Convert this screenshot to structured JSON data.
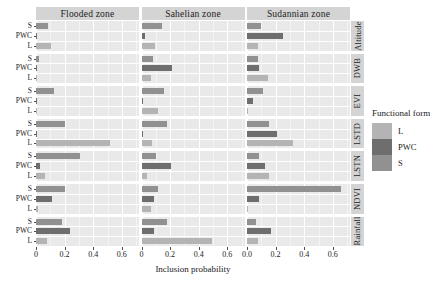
{
  "axis": {
    "xlabel": "Inclusion probability",
    "xticks_left": [
      "0",
      "0.2",
      "0.4",
      "0.6"
    ],
    "xticks_right": [
      "0.0",
      "0.2",
      "0.4",
      "0.6"
    ],
    "xtick_values": [
      0,
      0.2,
      0.4,
      0.6
    ],
    "xlim": [
      0,
      0.72
    ],
    "ycategories": [
      "S",
      "PWC",
      "L"
    ]
  },
  "legend": {
    "title": "Functional form",
    "items": [
      {
        "label": "L",
        "color": "#b4b4b4"
      },
      {
        "label": "PWC",
        "color": "#6e6e6e"
      },
      {
        "label": "S",
        "color": "#919191"
      }
    ]
  },
  "panels": {
    "columns": [
      "Flooded zone",
      "Sahelian zone",
      "Sudannian zone"
    ],
    "rows": [
      "Altitude",
      "DWB",
      "EVI",
      "LSTD",
      "LSTN",
      "NDVI",
      "Rainfall"
    ]
  },
  "colors": {
    "panel_bg": "#e9e9e9",
    "strip_bg": "#d4d4d4",
    "gridline": "#ffffff",
    "L": "#b4b4b4",
    "PWC": "#6e6e6e",
    "S": "#919191"
  },
  "chart_data": {
    "type": "bar",
    "orientation": "horizontal",
    "title": "",
    "xlabel": "Inclusion probability",
    "ylabel": "",
    "xlim": [
      0,
      0.72
    ],
    "grid": true,
    "legend_position": "right",
    "facet_cols": [
      "Flooded zone",
      "Sahelian zone",
      "Sudannian zone"
    ],
    "facet_rows": [
      "Altitude",
      "DWB",
      "EVI",
      "LSTD",
      "LSTN",
      "NDVI",
      "Rainfall"
    ],
    "categories": [
      "S",
      "PWC",
      "L"
    ],
    "panels": [
      {
        "row": "Altitude",
        "col": "Flooded zone",
        "series": [
          {
            "name": "S",
            "value": 0.085
          },
          {
            "name": "PWC",
            "value": 0.005
          },
          {
            "name": "L",
            "value": 0.105
          }
        ]
      },
      {
        "row": "Altitude",
        "col": "Sahelian zone",
        "series": [
          {
            "name": "S",
            "value": 0.145
          },
          {
            "name": "PWC",
            "value": 0.025
          },
          {
            "name": "L",
            "value": 0.095
          }
        ]
      },
      {
        "row": "Altitude",
        "col": "Sudannian zone",
        "series": [
          {
            "name": "S",
            "value": 0.1
          },
          {
            "name": "PWC",
            "value": 0.255
          },
          {
            "name": "L",
            "value": 0.075
          }
        ]
      },
      {
        "row": "DWB",
        "col": "Flooded zone",
        "series": [
          {
            "name": "S",
            "value": 0.02
          },
          {
            "name": "PWC",
            "value": 0.005
          },
          {
            "name": "L",
            "value": 0.0
          }
        ]
      },
      {
        "row": "DWB",
        "col": "Sahelian zone",
        "series": [
          {
            "name": "S",
            "value": 0.08
          },
          {
            "name": "PWC",
            "value": 0.215
          },
          {
            "name": "L",
            "value": 0.065
          }
        ]
      },
      {
        "row": "DWB",
        "col": "Sudannian zone",
        "series": [
          {
            "name": "S",
            "value": 0.075
          },
          {
            "name": "PWC",
            "value": 0.085
          },
          {
            "name": "L",
            "value": 0.145
          }
        ]
      },
      {
        "row": "EVI",
        "col": "Flooded zone",
        "series": [
          {
            "name": "S",
            "value": 0.125
          },
          {
            "name": "PWC",
            "value": 0.005
          },
          {
            "name": "L",
            "value": 0.0
          }
        ]
      },
      {
        "row": "EVI",
        "col": "Sahelian zone",
        "series": [
          {
            "name": "S",
            "value": 0.155
          },
          {
            "name": "PWC",
            "value": 0.006
          },
          {
            "name": "L",
            "value": 0.115
          }
        ]
      },
      {
        "row": "EVI",
        "col": "Sudannian zone",
        "series": [
          {
            "name": "S",
            "value": 0.11
          },
          {
            "name": "PWC",
            "value": 0.045
          },
          {
            "name": "L",
            "value": 0.004
          }
        ]
      },
      {
        "row": "LSTD",
        "col": "Flooded zone",
        "series": [
          {
            "name": "S",
            "value": 0.205
          },
          {
            "name": "PWC",
            "value": 0.005
          },
          {
            "name": "L",
            "value": 0.515
          }
        ]
      },
      {
        "row": "LSTD",
        "col": "Sahelian zone",
        "series": [
          {
            "name": "S",
            "value": 0.175
          },
          {
            "name": "PWC",
            "value": 0.005
          },
          {
            "name": "L",
            "value": 0.075
          }
        ]
      },
      {
        "row": "LSTD",
        "col": "Sudannian zone",
        "series": [
          {
            "name": "S",
            "value": 0.155
          },
          {
            "name": "PWC",
            "value": 0.21
          },
          {
            "name": "L",
            "value": 0.325
          }
        ]
      },
      {
        "row": "LSTN",
        "col": "Flooded zone",
        "series": [
          {
            "name": "S",
            "value": 0.305
          },
          {
            "name": "PWC",
            "value": 0.025
          },
          {
            "name": "L",
            "value": 0.065
          }
        ]
      },
      {
        "row": "LSTN",
        "col": "Sahelian zone",
        "series": [
          {
            "name": "S",
            "value": 0.1
          },
          {
            "name": "PWC",
            "value": 0.205
          },
          {
            "name": "L",
            "value": 0.035
          }
        ]
      },
      {
        "row": "LSTN",
        "col": "Sudannian zone",
        "series": [
          {
            "name": "S",
            "value": 0.085
          },
          {
            "name": "PWC",
            "value": 0.125
          },
          {
            "name": "L",
            "value": 0.155
          }
        ]
      },
      {
        "row": "NDVI",
        "col": "Flooded zone",
        "series": [
          {
            "name": "S",
            "value": 0.205
          },
          {
            "name": "PWC",
            "value": 0.115
          },
          {
            "name": "L",
            "value": 0.015
          }
        ]
      },
      {
        "row": "NDVI",
        "col": "Sahelian zone",
        "series": [
          {
            "name": "S",
            "value": 0.115
          },
          {
            "name": "PWC",
            "value": 0.085
          },
          {
            "name": "L",
            "value": 0.065
          }
        ]
      },
      {
        "row": "NDVI",
        "col": "Sudannian zone",
        "series": [
          {
            "name": "S",
            "value": 0.655
          },
          {
            "name": "PWC",
            "value": 0.085
          },
          {
            "name": "L",
            "value": 0.008
          }
        ]
      },
      {
        "row": "Rainfall",
        "col": "Flooded zone",
        "series": [
          {
            "name": "S",
            "value": 0.185
          },
          {
            "name": "PWC",
            "value": 0.235
          },
          {
            "name": "L",
            "value": 0.075
          }
        ]
      },
      {
        "row": "Rainfall",
        "col": "Sahelian zone",
        "series": [
          {
            "name": "S",
            "value": 0.175
          },
          {
            "name": "PWC",
            "value": 0.085
          },
          {
            "name": "L",
            "value": 0.495
          }
        ]
      },
      {
        "row": "Rainfall",
        "col": "Sudannian zone",
        "series": [
          {
            "name": "S",
            "value": 0.065
          },
          {
            "name": "PWC",
            "value": 0.165
          },
          {
            "name": "L",
            "value": 0.075
          }
        ]
      }
    ]
  }
}
